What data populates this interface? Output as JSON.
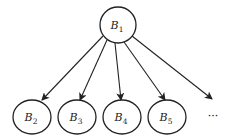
{
  "diagram": {
    "type": "tree",
    "root": {
      "id": "B1",
      "base": "B",
      "sub": "1",
      "cx": 118,
      "cy": 25,
      "rx": 18,
      "ry": 18
    },
    "children": [
      {
        "id": "B2",
        "base": "B",
        "sub": "2",
        "cx": 32,
        "cy": 117,
        "rx": 19,
        "ry": 17
      },
      {
        "id": "B3",
        "base": "B",
        "sub": "3",
        "cx": 77,
        "cy": 117,
        "rx": 19,
        "ry": 17
      },
      {
        "id": "B4",
        "base": "B",
        "sub": "4",
        "cx": 122,
        "cy": 117,
        "rx": 19,
        "ry": 17
      },
      {
        "id": "B5",
        "base": "B",
        "sub": "5",
        "cx": 167,
        "cy": 117,
        "rx": 19,
        "ry": 17
      }
    ],
    "ellipsis": {
      "text": "···",
      "x": 213,
      "y": 120
    },
    "edges": [
      {
        "from": "B1",
        "to": "B2",
        "x1": 103,
        "y1": 36,
        "x2": 42,
        "y2": 100
      },
      {
        "from": "B1",
        "to": "B3",
        "x1": 107,
        "y1": 40,
        "x2": 80,
        "y2": 100
      },
      {
        "from": "B1",
        "to": "B4",
        "x1": 115,
        "y1": 43,
        "x2": 121,
        "y2": 100
      },
      {
        "from": "B1",
        "to": "B5",
        "x1": 124,
        "y1": 42,
        "x2": 165,
        "y2": 100
      },
      {
        "from": "B1",
        "to": "ellipsis",
        "x1": 132,
        "y1": 36,
        "x2": 212,
        "y2": 99
      }
    ],
    "colors": {
      "stroke": "#222222",
      "fill": "#ffffff"
    }
  }
}
